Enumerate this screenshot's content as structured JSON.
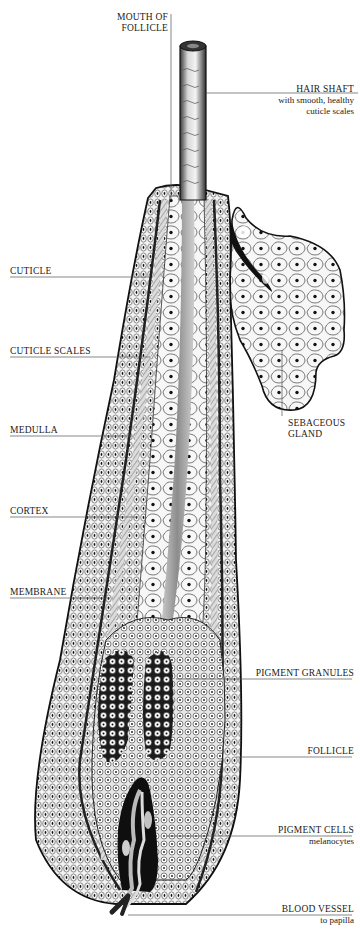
{
  "diagram": {
    "type": "anatomical-cross-section",
    "colors": {
      "ink": "#1a1a1a",
      "leader_line": "#555555",
      "background": "#ffffff",
      "shade": "#8c8c8c"
    }
  },
  "labels": {
    "mouth_of_follicle": {
      "line1": "MOUTH OF",
      "line2": "FOLLICLE"
    },
    "hair_shaft": {
      "title": "HAIR SHAFT",
      "sub1": "with smooth, healthy",
      "sub2": "cuticle scales"
    },
    "cuticle": {
      "title": "CUTICLE"
    },
    "cuticle_scales": {
      "title": "CUTICLE SCALES"
    },
    "medulla": {
      "title": "MEDULLA"
    },
    "sebaceous_gland": {
      "line1": "SEBACEOUS",
      "line2": "GLAND"
    },
    "cortex": {
      "title": "CORTEX"
    },
    "membrane": {
      "title": "MEMBRANE"
    },
    "pigment_granules": {
      "title": "PIGMENT GRANULES"
    },
    "follicle": {
      "title": "FOLLICLE"
    },
    "pigment_cells": {
      "title": "PIGMENT CELLS",
      "sub": "melanocytes"
    },
    "blood_vessel": {
      "title": "BLOOD VESSEL",
      "sub": "to papilla"
    }
  }
}
